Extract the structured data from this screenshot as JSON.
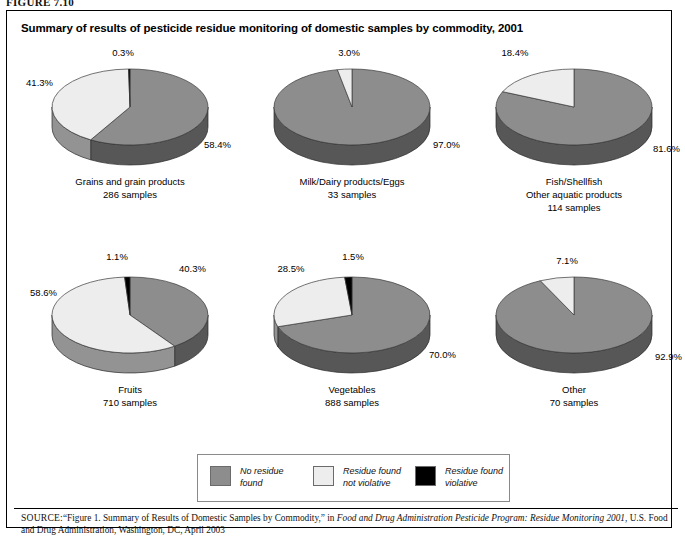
{
  "figure": {
    "label": "FIGURE 7.10",
    "title": "Summary of results of pesticide residue monitoring of domestic samples by commodity, 2001"
  },
  "legend": {
    "items": [
      {
        "label_line1": "No residue",
        "label_line2": "found",
        "color": "#8d8d8d",
        "key": "no-residue-found"
      },
      {
        "label_line1": "Residue found",
        "label_line2": "not violative",
        "color": "#ededed",
        "key": "residue-found-not-violative"
      },
      {
        "label_line1": "Residue found",
        "label_line2": "violative",
        "color": "#000000",
        "key": "residue-found-violative"
      }
    ]
  },
  "source": {
    "prefix": "SOURCE:",
    "text_1": "“Figure 1. Summary of Results of Domestic Samples by Commodity,” in ",
    "italic_1": "Food and Drug Administration Pesticide Program: Residue Monitoring 2001",
    "text_2": ", U.S. Food and Drug Administration, Washington, DC, April 2003"
  },
  "chart_data": {
    "type": "pie",
    "title": "Summary of results of pesticide residue monitoring of domestic samples by commodity, 2001",
    "units": "percent",
    "legend_position": "bottom-center",
    "series_names": [
      "No residue found",
      "Residue found not violative",
      "Residue found violative"
    ],
    "series_colors": [
      "#8d8d8d",
      "#ededed",
      "#000000"
    ],
    "charts": [
      {
        "name": "grains",
        "category_lines": [
          "Grains and grain products",
          "286 samples"
        ],
        "samples": 286,
        "labels": [
          "58.4%",
          "41.3%",
          "0.3%"
        ],
        "values": [
          58.4,
          41.3,
          0.3
        ]
      },
      {
        "name": "milk-dairy-eggs",
        "category_lines": [
          "Milk/Dairy products/Eggs",
          "33 samples"
        ],
        "samples": 33,
        "labels": [
          "97.0%",
          "3.0%",
          ""
        ],
        "values": [
          97.0,
          3.0,
          0.0
        ]
      },
      {
        "name": "fish-shellfish",
        "category_lines": [
          "Fish/Shellfish",
          "Other aquatic products",
          "114 samples"
        ],
        "samples": 114,
        "labels": [
          "81.6%",
          "18.4%",
          ""
        ],
        "values": [
          81.6,
          18.4,
          0.0
        ]
      },
      {
        "name": "fruits",
        "category_lines": [
          "Fruits",
          "710 samples"
        ],
        "samples": 710,
        "labels": [
          "40.3%",
          "58.6%",
          "1.1%"
        ],
        "values": [
          40.3,
          58.6,
          1.1
        ]
      },
      {
        "name": "vegetables",
        "category_lines": [
          "Vegetables",
          "888 samples"
        ],
        "samples": 888,
        "labels": [
          "70.0%",
          "28.5%",
          "1.5%"
        ],
        "values": [
          70.0,
          28.5,
          1.5
        ]
      },
      {
        "name": "other",
        "category_lines": [
          "Other",
          "70 samples"
        ],
        "samples": 70,
        "labels": [
          "92.9%",
          "7.1%",
          ""
        ],
        "values": [
          92.9,
          7.1,
          0.0
        ]
      }
    ]
  }
}
